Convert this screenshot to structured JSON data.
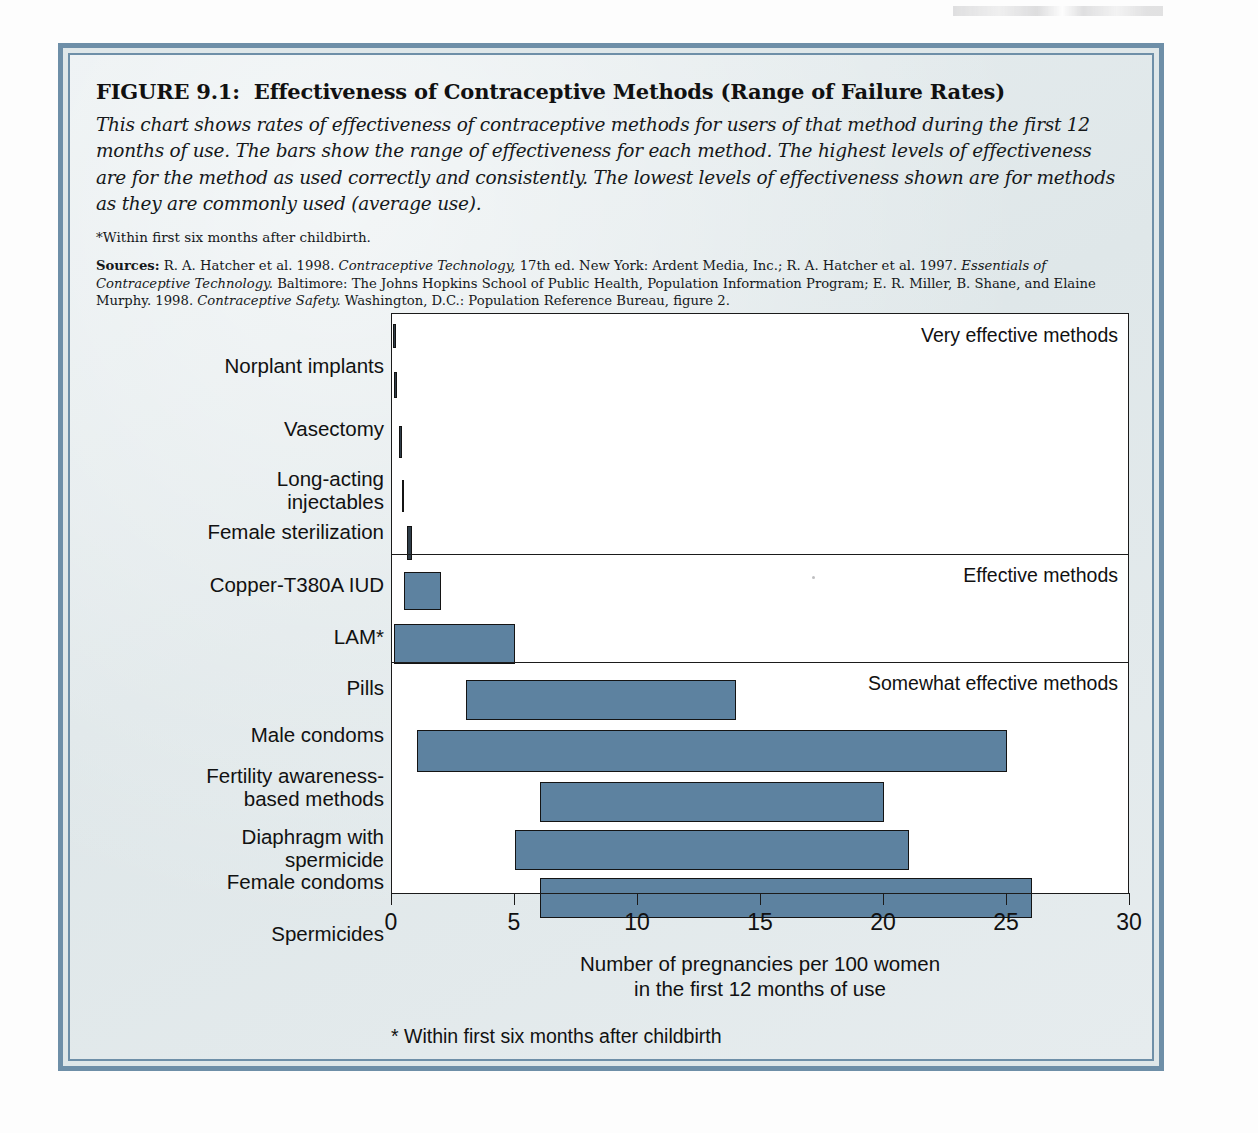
{
  "figure": {
    "number": "FIGURE 9.1:",
    "title": "Effectiveness of Contraceptive Methods (Range of Failure Rates)",
    "description": "This chart shows rates of effectiveness of contraceptive methods for users of that method during the first 12 months of use. The bars show the range of effectiveness for each method. The highest levels of effectiveness are for the method as used correctly and consistently. The lowest levels of effectiveness shown are for methods as they are commonly used (average use).",
    "footnote_top": "*Within first six months after childbirth.",
    "sources_label": "Sources:",
    "sources_text": "R. A. Hatcher et al. 1998. Contraceptive Technology, 17th ed. New York: Ardent Media, Inc.; R. A. Hatcher et al. 1997. Essentials of Contraceptive Technology. Baltimore: The Johns Hopkins School of Public Health, Population Information Program; E. R. Miller, B. Shane, and Elaine Murphy. 1998. Contraceptive Safety. Washington, D.C.: Population Reference Bureau, figure 2.",
    "sources_parts": [
      {
        "text": "R. A. Hatcher et al. 1998. ",
        "style": "roman"
      },
      {
        "text": "Contraceptive Technology,",
        "style": "italic"
      },
      {
        "text": " 17th ed. New York: Ardent Media, Inc.; R. A. Hatcher et al. 1997. ",
        "style": "roman"
      },
      {
        "text": "Essentials of Contraceptive Technology.",
        "style": "italic"
      },
      {
        "text": " Baltimore: The Johns Hopkins School of Public Health, Population Information Program; E. R. Miller, B. Shane, and Elaine Murphy. 1998. ",
        "style": "roman"
      },
      {
        "text": "Contraceptive Safety.",
        "style": "italic"
      },
      {
        "text": " Washington, D.C.: Population Reference Bureau, figure 2.",
        "style": "roman"
      }
    ]
  },
  "chart_footnote": "* Within first six months after childbirth",
  "colors": {
    "bar_fill": "#5d82a0",
    "bar_stroke": "#141414",
    "frame_blue": "#6e8fa8",
    "page_bg": "#e3eaec",
    "plot_bg": "#ffffff"
  },
  "chart_data": {
    "type": "bar",
    "orientation": "horizontal",
    "subtype": "range",
    "title": "Effectiveness of Contraceptive Methods (Range of Failure Rates)",
    "xlabel": "Number of pregnancies per 100 women\nin the first 12 months of use",
    "xlabel_line1": "Number of pregnancies per 100 women",
    "xlabel_line2": "in the first 12 months of use",
    "ylabel": "",
    "xlim": [
      0,
      30
    ],
    "xticks": [
      0,
      5,
      10,
      15,
      20,
      25,
      30
    ],
    "xtick_labels": [
      "0",
      "5",
      "10",
      "15",
      "20",
      "25",
      "30"
    ],
    "grid": false,
    "legend": "none",
    "categories": [
      "Norplant implants",
      "Vasectomy",
      "Long-acting injectables",
      "Female sterilization",
      "Copper-T380A IUD",
      "LAM*",
      "Pills",
      "Male condoms",
      "Fertility awareness-based methods",
      "Diaphragm with spermicide",
      "Female condoms",
      "Spermicides"
    ],
    "low": [
      0.05,
      0.1,
      0.3,
      0.4,
      0.6,
      0.5,
      0.1,
      3.0,
      1.0,
      6.0,
      5.0,
      6.0
    ],
    "high": [
      0.1,
      0.15,
      0.3,
      0.4,
      0.8,
      2.0,
      5.0,
      14.0,
      25.0,
      20.0,
      21.0,
      26.0
    ],
    "groups": [
      {
        "label": "Very effective methods",
        "members": [
          "Norplant implants",
          "Vasectomy",
          "Long-acting injectables",
          "Female sterilization",
          "Copper-T380A IUD"
        ]
      },
      {
        "label": "Effective methods",
        "members": [
          "LAM*",
          "Pills"
        ]
      },
      {
        "label": "Somewhat effective methods",
        "members": [
          "Male condoms",
          "Fertility awareness-based methods",
          "Diaphragm with spermicide",
          "Female condoms",
          "Spermicides"
        ]
      }
    ],
    "bars": [
      {
        "label": "Norplant implants",
        "label_lines": [
          "Norplant implants"
        ],
        "low": 0.05,
        "high": 0.1
      },
      {
        "label": "Vasectomy",
        "label_lines": [
          "Vasectomy"
        ],
        "low": 0.1,
        "high": 0.15
      },
      {
        "label": "Long-acting injectables",
        "label_lines": [
          "Long-acting",
          "injectables"
        ],
        "low": 0.3,
        "high": 0.3
      },
      {
        "label": "Female sterilization",
        "label_lines": [
          "Female sterilization"
        ],
        "low": 0.4,
        "high": 0.4
      },
      {
        "label": "Copper-T380A IUD",
        "label_lines": [
          "Copper-T380A IUD"
        ],
        "low": 0.6,
        "high": 0.8
      },
      {
        "label": "LAM*",
        "label_lines": [
          "LAM*"
        ],
        "low": 0.5,
        "high": 2.0
      },
      {
        "label": "Pills",
        "label_lines": [
          "Pills"
        ],
        "low": 0.1,
        "high": 5.0
      },
      {
        "label": "Male condoms",
        "label_lines": [
          "Male condoms"
        ],
        "low": 3.0,
        "high": 14.0
      },
      {
        "label": "Fertility awareness-based methods",
        "label_lines": [
          "Fertility awareness-",
          "based methods"
        ],
        "low": 1.0,
        "high": 25.0
      },
      {
        "label": "Diaphragm with spermicide",
        "label_lines": [
          "Diaphragm with",
          "spermicide"
        ],
        "low": 6.0,
        "high": 20.0
      },
      {
        "label": "Female condoms",
        "label_lines": [
          "Female condoms"
        ],
        "low": 5.0,
        "high": 21.0
      },
      {
        "label": "Spermicides",
        "label_lines": [
          "Spermicides"
        ],
        "low": 6.0,
        "high": 26.0
      }
    ]
  }
}
